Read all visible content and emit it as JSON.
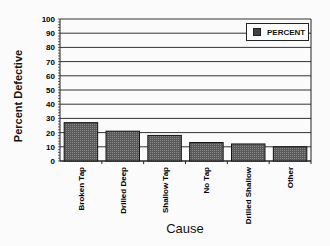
{
  "chart_data": {
    "type": "bar",
    "title": "",
    "xlabel": "Cause",
    "ylabel": "Percent Defective",
    "ylim": [
      0,
      100
    ],
    "yticks": [
      0,
      10,
      20,
      30,
      40,
      50,
      60,
      70,
      80,
      90,
      100
    ],
    "grid": true,
    "legend_position": "upper right",
    "categories": [
      "Broken Tap",
      "Drilled Deep",
      "Shallow Tap",
      "No Tap",
      "Drilled Shallow",
      "Other"
    ],
    "series": [
      {
        "name": "PERCENT",
        "values": [
          27,
          21,
          18,
          13,
          12,
          10
        ]
      }
    ]
  },
  "legend": {
    "label": "PERCENT"
  },
  "colors": {
    "bar": "#5a5a5a",
    "grid": "#333333",
    "background": "#fbfbfb"
  }
}
